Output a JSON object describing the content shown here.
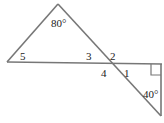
{
  "diagram": {
    "labels": {
      "apex_angle": "80°",
      "angle_5": "5",
      "angle_3": "3",
      "angle_2": "2",
      "angle_4": "4",
      "angle_1": "1",
      "bottom_angle": "40°"
    },
    "colors": {
      "line": "#777777",
      "text": "#222222"
    }
  }
}
